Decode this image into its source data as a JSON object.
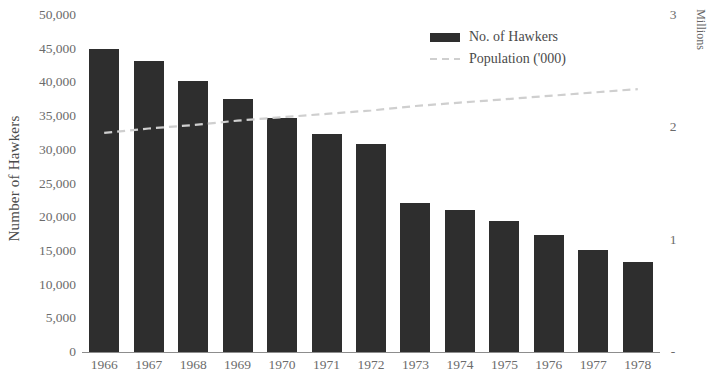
{
  "chart_data": {
    "type": "bar",
    "title": "",
    "subtitle": "",
    "categories": [
      "1966",
      "1967",
      "1968",
      "1969",
      "1970",
      "1971",
      "1972",
      "1973",
      "1974",
      "1975",
      "1976",
      "1977",
      "1978"
    ],
    "xlabel": "",
    "ylabel": "Number of Hawkers",
    "ylim": [
      0,
      50000
    ],
    "yticks": [
      "0",
      "5,000",
      "10,000",
      "15,000",
      "20,000",
      "25,000",
      "30,000",
      "35,000",
      "40,000",
      "45,000",
      "50,000"
    ],
    "ytick_values": [
      0,
      5000,
      10000,
      15000,
      20000,
      25000,
      30000,
      35000,
      40000,
      45000,
      50000
    ],
    "y2label": "Millions",
    "y2lim": [
      0,
      3
    ],
    "y2ticks": [
      "-",
      "1",
      "2",
      "3"
    ],
    "y2tick_values": [
      0,
      1,
      2,
      3
    ],
    "grid": false,
    "legend_position": "top-right",
    "series": [
      {
        "name": "No. of Hawkers",
        "type": "bar",
        "axis": "left",
        "color": "#2e2e2e",
        "values": [
          45000,
          43200,
          40200,
          37500,
          34700,
          32400,
          30900,
          22100,
          21000,
          19400,
          17400,
          15100,
          13400
        ]
      },
      {
        "name": "Population ('000)",
        "type": "line",
        "axis": "right",
        "style": "dashed",
        "color": "#cfcfcf",
        "values": [
          1.95,
          1.99,
          2.02,
          2.06,
          2.09,
          2.12,
          2.15,
          2.19,
          2.22,
          2.25,
          2.28,
          2.31,
          2.34
        ]
      }
    ]
  },
  "legend": {
    "items": [
      {
        "label": "No. of Hawkers",
        "marker": "bar-swatch"
      },
      {
        "label": "Population ('000)",
        "marker": "dashed-line-swatch"
      }
    ]
  },
  "axes": {
    "left_title": "Number of Hawkers",
    "right_title": "Millions"
  }
}
